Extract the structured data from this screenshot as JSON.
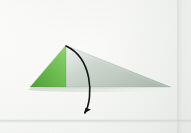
{
  "scene": {
    "kind": "origami-instruction-photo",
    "caption_visible": false,
    "width_px": 191,
    "height_px": 133,
    "background_color": "#f4f5f2",
    "paper_surface": "white matte paper sheet"
  },
  "model": {
    "name": "folded-paper-triangle",
    "description": "Flat folded origami triangle resting on white paper, seen from the side",
    "apex": {
      "x": 66,
      "y": 45
    },
    "left_base_corner": {
      "x": 30,
      "y": 87
    },
    "right_tip": {
      "x": 171,
      "y": 87
    },
    "baseline_y": 87,
    "facets": [
      {
        "name": "left-green-facet",
        "color": "#6cbe50",
        "color_light": "#92d072",
        "color_dark": "#4d9e37",
        "points": "30,87 66,45 66,87",
        "material": "green side of the paper"
      },
      {
        "name": "right-gray-facet",
        "color": "#c6d1c9",
        "color_light": "#d9e1da",
        "color_dark": "#aab7ac",
        "points": "66,45 171,87 66,87",
        "material": "white/underside of the paper in shadow"
      }
    ],
    "cast_shadow_color": "#d2d8d1"
  },
  "annotation": {
    "arrow": {
      "name": "fold-arrow",
      "meaning": "fold the top flap downward and to the front",
      "color": "#141414",
      "stroke_width": 1.6,
      "start": {
        "x": 66,
        "y": 46
      },
      "control_1": {
        "x": 92,
        "y": 58
      },
      "control_2": {
        "x": 94,
        "y": 96
      },
      "end": {
        "x": 85,
        "y": 113
      },
      "head": {
        "name": "arrowhead",
        "tip": {
          "x": 83,
          "y": 121
        },
        "direction": "down-left",
        "length_px": 10,
        "width_px": 6
      }
    }
  },
  "labels": {
    "figure_title": "",
    "step_number": "",
    "notes": ""
  }
}
